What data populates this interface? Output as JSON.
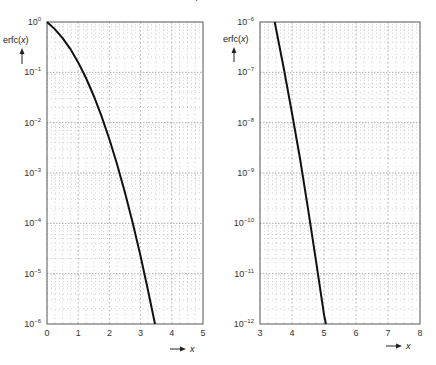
{
  "chart_data": [
    {
      "type": "line",
      "title": "",
      "xlabel": "x",
      "ylabel": "erfc(x)",
      "yscale": "log",
      "xlim": [
        0,
        5
      ],
      "ylim": [
        1e-06,
        1
      ],
      "xticks": [
        "0",
        "1",
        "2",
        "3",
        "4",
        "5"
      ],
      "yticks": [
        "10^0",
        "10^-1",
        "10^-2",
        "10^-3",
        "10^-4",
        "10^-5",
        "10^-6"
      ],
      "grid": true,
      "series": [
        {
          "name": "erfc(x)",
          "x": [
            0,
            0.25,
            0.5,
            0.75,
            1.0,
            1.25,
            1.5,
            1.75,
            2.0,
            2.25,
            2.5,
            2.75,
            3.0,
            3.25,
            3.46
          ],
          "y": [
            1.0,
            0.7237,
            0.4795,
            0.2888,
            0.1573,
            0.0771,
            0.0339,
            0.01333,
            0.004678,
            0.001463,
            0.000407,
            0.0001008,
            2.209e-05,
            4.27e-06,
            1e-06
          ]
        }
      ]
    },
    {
      "type": "line",
      "title": "",
      "xlabel": "x",
      "ylabel": "erfc(x)",
      "yscale": "log",
      "xlim": [
        3,
        8
      ],
      "ylim": [
        1e-12,
        1e-06
      ],
      "xticks": [
        "3",
        "4",
        "5",
        "6",
        "7",
        "8"
      ],
      "yticks": [
        "10^-6",
        "10^-7",
        "10^-8",
        "10^-9",
        "10^-10",
        "10^-11",
        "10^-12"
      ],
      "grid": true,
      "series": [
        {
          "name": "erfc(x)",
          "x": [
            3.46,
            3.75,
            4.0,
            4.25,
            4.5,
            4.75,
            5.0,
            5.06
          ],
          "y": [
            1e-06,
            1.14e-07,
            1.542e-08,
            1.94e-09,
            1.966e-10,
            1.79e-11,
            1.537e-12,
            1e-12
          ]
        }
      ]
    }
  ],
  "labels": {
    "left_ylabel": "erfc(x)",
    "left_xlabel": "x",
    "right_ylabel": "erfc(x)",
    "right_xlabel": "x"
  }
}
